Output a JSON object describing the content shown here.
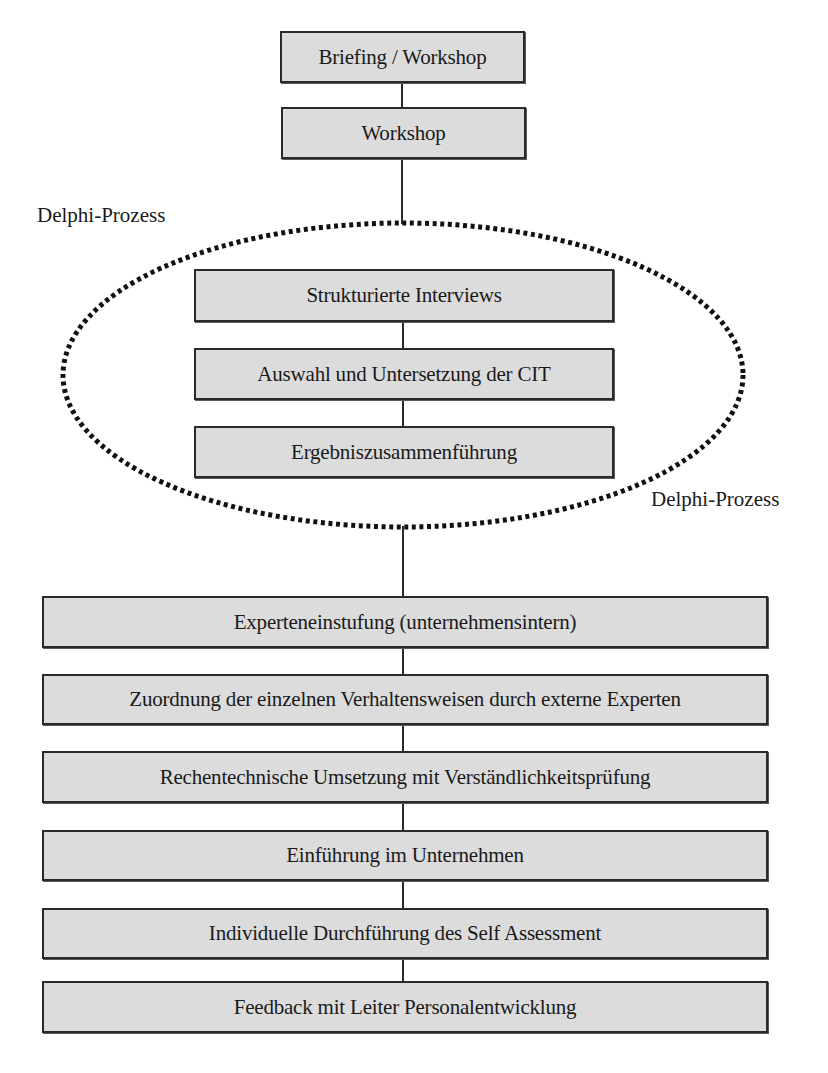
{
  "diagram": {
    "type": "flowchart",
    "colors": {
      "box_fill": "#dcdcdc",
      "box_border": "#2a2a2a",
      "connector": "#2a2a2a",
      "ellipse_dots": "#111111",
      "text": "#1a1a1a"
    },
    "top_steps": [
      {
        "id": "briefing",
        "label": "Briefing / Workshop"
      },
      {
        "id": "workshop",
        "label": "Workshop"
      }
    ],
    "delphi_group": {
      "label_top_left": "Delphi-Prozess",
      "label_bottom_right": "Delphi-Prozess",
      "steps": [
        {
          "id": "interviews",
          "label": "Strukturierte Interviews"
        },
        {
          "id": "cit",
          "label": "Auswahl und Untersetzung der CIT"
        },
        {
          "id": "merge",
          "label": "Ergebniszusammenführung"
        }
      ]
    },
    "bottom_steps": [
      {
        "id": "expert-rating",
        "label": "Experteneinstufung (unternehmensintern)"
      },
      {
        "id": "assignment",
        "label": "Zuordnung der einzelnen Verhaltensweisen durch externe Experten"
      },
      {
        "id": "implementation",
        "label": "Rechentechnische Umsetzung mit Verständlichkeitsprüfung"
      },
      {
        "id": "introduction",
        "label": "Einführung im Unternehmen"
      },
      {
        "id": "self-assessment",
        "label": "Individuelle Durchführung des Self Assessment"
      },
      {
        "id": "feedback",
        "label": "Feedback mit Leiter Personalentwicklung"
      }
    ]
  }
}
